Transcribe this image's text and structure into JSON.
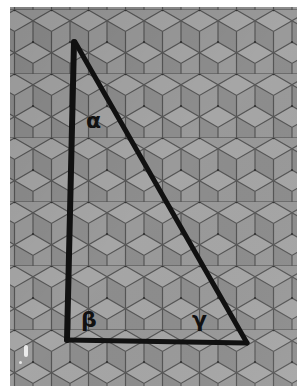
{
  "image": {
    "description": "Photograph of a tumbling-blocks (rhombille) tiled surface with a hand-drawn right triangle and angle labels",
    "background_tones": [
      "#8f8f8f",
      "#a3a3a3",
      "#7c7c7c"
    ],
    "tile_edge_color": "#4e4e4e",
    "line_color": "#111111"
  },
  "triangle": {
    "vertices": {
      "top": [
        74,
        42
      ],
      "bottom_left": [
        67,
        340
      ],
      "bottom_right": [
        247,
        343
      ]
    },
    "labels": {
      "alpha": "α",
      "beta": "β",
      "gamma": "γ"
    }
  }
}
